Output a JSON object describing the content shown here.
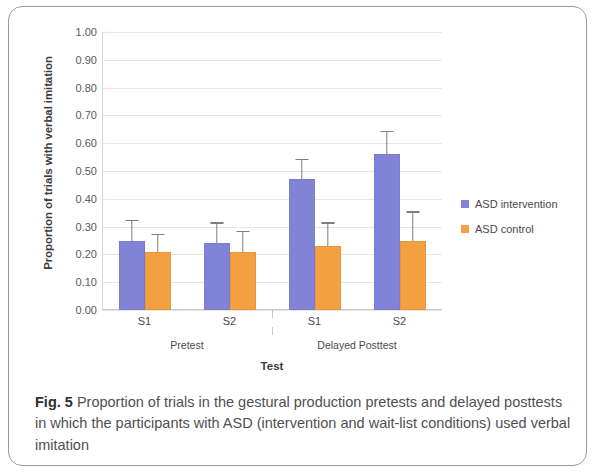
{
  "figure": {
    "number_label": "Fig. 5",
    "caption": "Proportion of trials in the gestural production pretests and delayed posttests in which the participants with ASD (intervention and wait-list conditions) used verbal imitation"
  },
  "legend": {
    "position": "right",
    "items": [
      {
        "label": "ASD intervention",
        "color": "#8083d6"
      },
      {
        "label": "ASD control",
        "color": "#f3a041"
      }
    ]
  },
  "axes": {
    "y_title": "Proportion of trials with verbal imitation",
    "x_title": "Test",
    "y_ticks": [
      "0.00",
      "0.10",
      "0.20",
      "0.30",
      "0.40",
      "0.50",
      "0.60",
      "0.70",
      "0.80",
      "0.90",
      "1.00"
    ],
    "sub_ticks": [
      "S1",
      "S2",
      "S1",
      "S2"
    ],
    "group_ticks": [
      "Pretest",
      "Delayed Posttest"
    ]
  },
  "chart_data": {
    "type": "bar",
    "title": "Proportion of trials in the gestural production pretests and delayed posttests in which the participants with ASD (intervention and wait-list conditions) used verbal imitation",
    "xlabel": "Test",
    "ylabel": "Proportion of trials with verbal imitation",
    "ylim": [
      0.0,
      1.0
    ],
    "ytick_step": 0.1,
    "grid": true,
    "legend_position": "right",
    "groups": [
      "Pretest",
      "Delayed Posttest"
    ],
    "categories": [
      "S1",
      "S2",
      "S1",
      "S2"
    ],
    "series": [
      {
        "name": "ASD intervention",
        "color": "#8083d6",
        "values": [
          0.25,
          0.24,
          0.47,
          0.56
        ],
        "errors": [
          0.07,
          0.07,
          0.07,
          0.08
        ]
      },
      {
        "name": "ASD control",
        "color": "#f3a041",
        "values": [
          0.21,
          0.21,
          0.23,
          0.25
        ],
        "errors": [
          0.06,
          0.07,
          0.08,
          0.1
        ]
      }
    ]
  }
}
